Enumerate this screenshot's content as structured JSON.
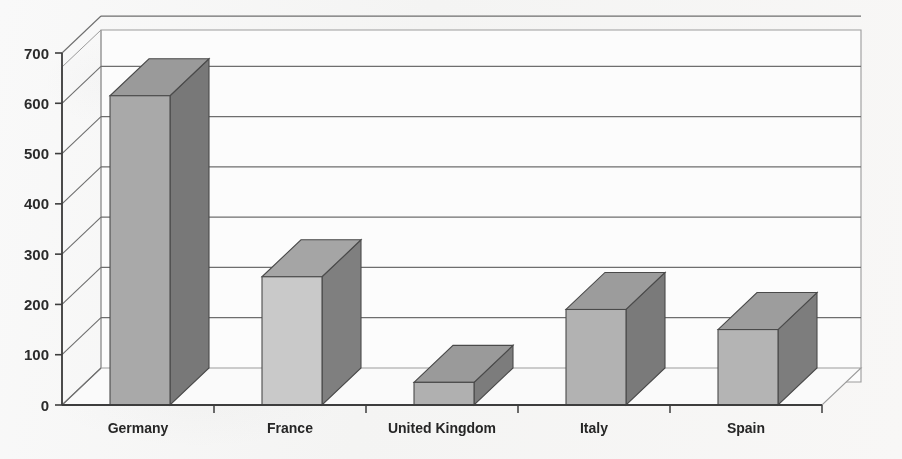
{
  "chart_data": {
    "type": "bar",
    "title": "",
    "subtitle": "",
    "xlabel": "",
    "ylabel": "",
    "categories": [
      "Germany",
      "France",
      "United Kingdom",
      "Italy",
      "Spain"
    ],
    "values": [
      615,
      255,
      45,
      190,
      150
    ],
    "series": [
      {
        "name": "Series 1",
        "values": [
          615,
          255,
          45,
          190,
          150
        ]
      }
    ],
    "ylim": [
      0,
      700
    ],
    "ytick_labels": [
      "0",
      "100",
      "200",
      "300",
      "400",
      "500",
      "600",
      "700"
    ],
    "ytick_values": [
      0,
      100,
      200,
      300,
      400,
      500,
      600,
      700
    ],
    "grid": true,
    "grid_axis": "y",
    "legend": false,
    "legend_position": "none",
    "style": "3d-column",
    "annotations": []
  },
  "colors": {
    "background": "#fbfbfb",
    "bar_front_default": "#a9a9a9",
    "bar_front_light": "#c9c9c9",
    "bar_top": "#9a9a9a",
    "bar_side": "#787878",
    "bar_outline": "#4a4a4a",
    "axis": "#3d3d3d",
    "gridline": "#6e6e6e",
    "wall_edge": "#9b9b9b",
    "floor": "#fafafa",
    "text": "#2b2b2b"
  },
  "bar_shading": [
    {
      "category": "Germany",
      "front": "#a9a9a9",
      "top": "#9a9a9a",
      "side": "#787878"
    },
    {
      "category": "France",
      "front": "#c9c9c9",
      "top": "#a5a5a5",
      "side": "#7f7f7f"
    },
    {
      "category": "United Kingdom",
      "front": "#b0b0b0",
      "top": "#9a9a9a",
      "side": "#7c7c7c"
    },
    {
      "category": "Italy",
      "front": "#b2b2b2",
      "top": "#9c9c9c",
      "side": "#7a7a7a"
    },
    {
      "category": "Spain",
      "front": "#b4b4b4",
      "top": "#9d9d9d",
      "side": "#7d7d7d"
    }
  ]
}
